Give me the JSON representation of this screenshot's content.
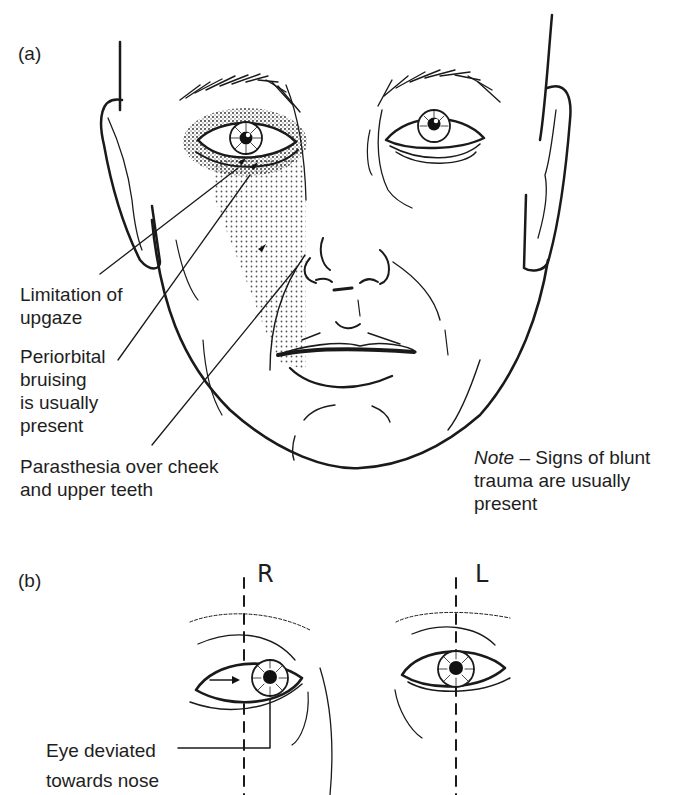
{
  "figure": {
    "panel_a": {
      "label": "(a)",
      "callouts": [
        {
          "id": "upgaze",
          "text": "Limitation of\nupgaze"
        },
        {
          "id": "bruising",
          "text": "Periorbital\nbruising\nis usually\npresent"
        },
        {
          "id": "parasthesia",
          "text": "Parasthesia over cheek\nand upper teeth"
        }
      ],
      "note": {
        "emphasis": "Note",
        "text": " – Signs of blunt\ntrauma are usually\npresent"
      }
    },
    "panel_b": {
      "label": "(b)",
      "right_eye_label": "R",
      "left_eye_label": "L",
      "callout": "Eye deviated\ntowards nose"
    }
  },
  "colors": {
    "ink": "#1a1a1a",
    "stipple": "#555555",
    "background": "#ffffff"
  }
}
